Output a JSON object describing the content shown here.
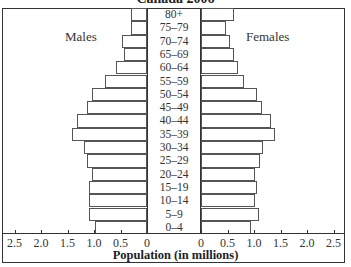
{
  "chart_data": {
    "type": "bar",
    "subtype": "population-pyramid",
    "title": "Canada 2006",
    "xlabel": "Population (in millions)",
    "ylabel": "",
    "categories": [
      "80+",
      "75–79",
      "70–74",
      "65–69",
      "60–64",
      "55–59",
      "50–54",
      "45–49",
      "40–44",
      "35–39",
      "30–34",
      "25–29",
      "20–24",
      "15–19",
      "10–14",
      "5–9",
      "0–4"
    ],
    "series": [
      {
        "name": "Males",
        "side": "left",
        "values": [
          0.3,
          0.3,
          0.47,
          0.43,
          0.58,
          0.79,
          1.04,
          1.13,
          1.32,
          1.42,
          1.19,
          1.13,
          1.04,
          1.09,
          1.09,
          1.09,
          0.98
        ]
      },
      {
        "name": "Females",
        "side": "right",
        "values": [
          0.62,
          0.47,
          0.55,
          0.62,
          0.7,
          0.81,
          1.06,
          1.15,
          1.32,
          1.4,
          1.17,
          1.11,
          1.02,
          1.06,
          1.02,
          1.09,
          0.94
        ]
      }
    ],
    "xlim": [
      0,
      2.5
    ],
    "left_ticks": [
      "2.5",
      "2.0",
      "1.5",
      "1.0",
      "0.5",
      "0"
    ],
    "right_ticks": [
      "0",
      "0.5",
      "1.0",
      "1.5",
      "2.0",
      "2.5"
    ],
    "grid": false,
    "legend": {
      "left_label": "Males",
      "right_label": "Females",
      "position": "inside-top"
    }
  }
}
